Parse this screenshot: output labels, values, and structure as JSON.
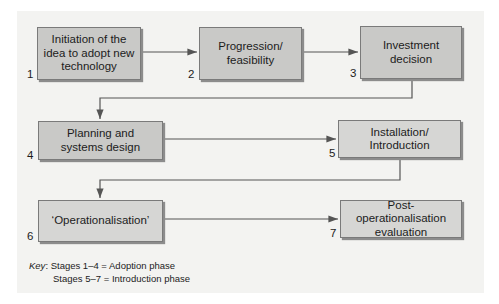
{
  "diagram": {
    "stages": [
      {
        "num": "1",
        "label": "Initiation of the idea to adopt new technology"
      },
      {
        "num": "2",
        "label": "Progression/ feasibility"
      },
      {
        "num": "3",
        "label": "Investment decision"
      },
      {
        "num": "4",
        "label": "Planning and systems design"
      },
      {
        "num": "5",
        "label": "Installation/ Introduction"
      },
      {
        "num": "6",
        "label": "‘Operationalisation’"
      },
      {
        "num": "7",
        "label": "Post-operationalisation evaluation"
      }
    ],
    "key": {
      "label": "Key",
      "line1": ": Stages 1–4 = Adoption phase",
      "line2": "Stages 5–7 = Introduction phase"
    },
    "colors": {
      "box_fill": "#c9c9c7",
      "panel": "#f3f3f1",
      "line": "#555555"
    }
  }
}
